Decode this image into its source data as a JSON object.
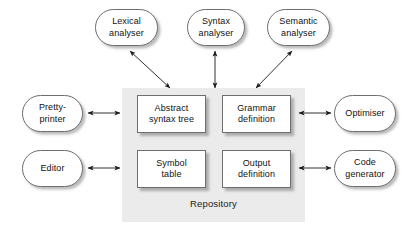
{
  "diagram": {
    "type": "block-diagram",
    "colors": {
      "panel_background": "#ecebeb",
      "box_fill": "#ffffff",
      "box_border": "#6e6e6e",
      "arrow": "#1a1a1a",
      "text": "#111111",
      "page_background": "#ffffff"
    },
    "repository": {
      "label": "Repository",
      "items": [
        {
          "id": "abstract-syntax-tree",
          "label": "Abstract\nsyntax tree",
          "line1": "Abstract",
          "line2": "syntax tree"
        },
        {
          "id": "grammar-definition",
          "label": "Grammar\ndefinition",
          "line1": "Grammar",
          "line2": "definition"
        },
        {
          "id": "symbol-table",
          "label": "Symbol\ntable",
          "line1": "Symbol",
          "line2": "table"
        },
        {
          "id": "output-definition",
          "label": "Output\ndefinition",
          "line1": "Output",
          "line2": "definition"
        }
      ]
    },
    "tools": {
      "top": [
        {
          "id": "lexical-analyser",
          "label": "Lexical\nanalyser",
          "line1": "Lexical",
          "line2": "analyser"
        },
        {
          "id": "syntax-analyser",
          "label": "Syntax\nanalyser",
          "line1": "Syntax",
          "line2": "analyser"
        },
        {
          "id": "semantic-analyser",
          "label": "Semantic\nanalyser",
          "line1": "Semantic",
          "line2": "analyser"
        }
      ],
      "left": [
        {
          "id": "pretty-printer",
          "label": "Pretty-\nprinter",
          "line1": "Pretty-",
          "line2": "printer"
        },
        {
          "id": "editor",
          "label": "Editor",
          "line1": "Editor",
          "line2": ""
        }
      ],
      "right": [
        {
          "id": "optimiser",
          "label": "Optimiser",
          "line1": "Optimiser",
          "line2": ""
        },
        {
          "id": "code-generator",
          "label": "Code\ngenerator",
          "line1": "Code",
          "line2": "generator"
        }
      ]
    },
    "connections": [
      {
        "id": "lexical-to-ast",
        "from": "lexical-analyser",
        "to": "abstract-syntax-tree",
        "style": "double-headed-diagonal"
      },
      {
        "id": "syntax-to-ast",
        "from": "syntax-analyser",
        "to": "abstract-syntax-tree",
        "style": "double-headed-vertical"
      },
      {
        "id": "semantic-to-grammar",
        "from": "semantic-analyser",
        "to": "grammar-definition",
        "style": "double-headed-diagonal"
      },
      {
        "id": "prettyprinter-to-repository",
        "from": "pretty-printer",
        "to": "repository",
        "style": "double-headed-horizontal"
      },
      {
        "id": "editor-to-repository",
        "from": "editor",
        "to": "repository",
        "style": "double-headed-horizontal"
      },
      {
        "id": "repository-to-optimiser",
        "from": "repository",
        "to": "optimiser",
        "style": "double-headed-horizontal"
      },
      {
        "id": "repository-to-codegenerator",
        "from": "repository",
        "to": "code-generator",
        "style": "double-headed-horizontal"
      }
    ]
  }
}
